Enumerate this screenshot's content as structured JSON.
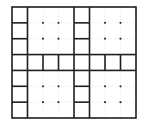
{
  "diagram": {
    "grid": {
      "origin_x": 12,
      "origin_y": 7,
      "cols": 8,
      "rows": 7,
      "cell_w": 15.5,
      "cell_h": 15.857
    },
    "merged_blocks": [
      {
        "col": 1,
        "row": 0,
        "span_cols": 3,
        "span_rows": 3
      },
      {
        "col": 5,
        "row": 0,
        "span_cols": 3,
        "span_rows": 3
      },
      {
        "col": 1,
        "row": 4,
        "span_cols": 3,
        "span_rows": 3
      },
      {
        "col": 5,
        "row": 4,
        "span_cols": 3,
        "span_rows": 3
      }
    ],
    "colors": {
      "line": "#1e1e1e",
      "faint_line": "#d4d4d4",
      "dot": "#333333",
      "background": "#ffffff"
    },
    "line_width": 1.6,
    "dot_radius": 1.1
  }
}
